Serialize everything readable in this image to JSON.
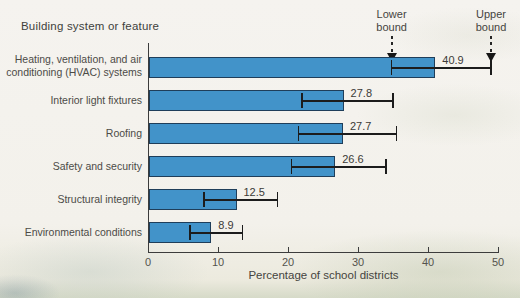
{
  "chart_data": {
    "type": "bar",
    "orientation": "horizontal",
    "title": "Building system or feature",
    "xlabel": "Percentage of school districts",
    "xlim": [
      0,
      50
    ],
    "xticks": [
      0,
      10,
      20,
      30,
      40,
      50
    ],
    "grid": false,
    "legend": "none",
    "bar_color": "#4293c9",
    "bar_border_color": "#1f3e5a",
    "categories": [
      "Heating, ventilation, and air conditioning (HVAC) systems",
      "Interior light fixtures",
      "Roofing",
      "Safety and security",
      "Structural integrity",
      "Environmental conditions"
    ],
    "category_lines": [
      [
        "Heating, ventilation, and air",
        "conditioning (HVAC) systems"
      ],
      [
        "Interior light fixtures"
      ],
      [
        "Roofing"
      ],
      [
        "Safety and security"
      ],
      [
        "Structural integrity"
      ],
      [
        "Environmental conditions"
      ]
    ],
    "values": [
      40.9,
      27.8,
      27.7,
      26.6,
      12.5,
      8.9
    ],
    "error_bounds": [
      {
        "lower": 34.8,
        "upper": 49.0
      },
      {
        "lower": 22.0,
        "upper": 35.0
      },
      {
        "lower": 21.5,
        "upper": 35.5
      },
      {
        "lower": 20.5,
        "upper": 34.0
      },
      {
        "lower": 8.0,
        "upper": 18.5
      },
      {
        "lower": 6.0,
        "upper": 13.5
      }
    ],
    "annotations": [
      {
        "text": "Lower bound",
        "bound": "lower",
        "row": 0
      },
      {
        "text": "Upper bound",
        "bound": "upper",
        "row": 0
      }
    ]
  }
}
